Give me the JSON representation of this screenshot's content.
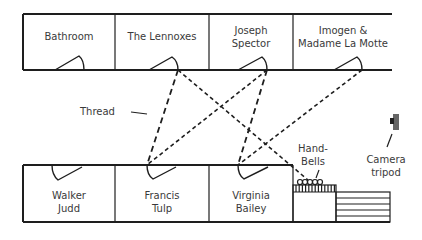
{
  "diagram": {
    "top_rooms": [
      {
        "name": "Bathroom"
      },
      {
        "name": "The Lennoxes"
      },
      {
        "name": "Joseph\nSpector"
      },
      {
        "name": "Imogen &\nMadame La Motte"
      }
    ],
    "bottom_rooms": [
      {
        "name": "Walker\nJudd"
      },
      {
        "name": "Francis\nTulp"
      },
      {
        "name": "Virginia\nBailey"
      }
    ],
    "labels": {
      "thread": "Thread",
      "handbells": "Hand-\nBells",
      "camera": "Camera\ntripod"
    },
    "colors": {
      "line": "#1e1e1e",
      "text": "#3a3a3a",
      "camera": "#555555"
    }
  }
}
